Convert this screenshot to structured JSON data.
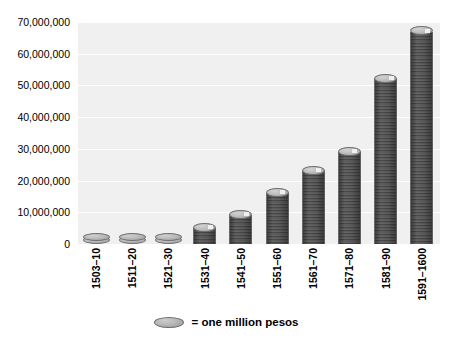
{
  "chart_data": {
    "type": "bar",
    "title": "",
    "subtitle": "",
    "xlabel": "",
    "ylabel": "",
    "categories": [
      "1503–10",
      "1511–20",
      "1521–30",
      "1531–40",
      "1541–50",
      "1551–60",
      "1561–70",
      "1571–80",
      "1581–90",
      "1591–1600"
    ],
    "values": [
      2000000,
      3000000,
      2000000,
      5000000,
      9000000,
      16000000,
      23000000,
      29000000,
      52000000,
      67000000
    ],
    "ylim": [
      0,
      70000000
    ],
    "ytick_values": [
      0,
      10000000,
      20000000,
      30000000,
      40000000,
      50000000,
      60000000,
      70000000
    ],
    "ytick_labels": [
      "0",
      "10,000,000",
      "20,000,000",
      "30,000,000",
      "40,000,000",
      "50,000,000",
      "60,000,000",
      "70,000,000"
    ],
    "grid": true,
    "legend_position": "bottom-center",
    "legend": [
      {
        "marker": "coin-disc",
        "label": "= one million pesos"
      }
    ],
    "annotations": [],
    "style": {
      "plot_background": "#f0f0f0",
      "figure_background": "#ffffff",
      "gridline_color": "#ffffff",
      "coin_top_color": "#bdbdbd",
      "coin_side_color": "#8e8e8e",
      "coin_edge_color": "#6f6f6f",
      "text_color": "#000000"
    }
  },
  "legend": {
    "marker_name": "coin-disc",
    "text": "= one million pesos"
  }
}
